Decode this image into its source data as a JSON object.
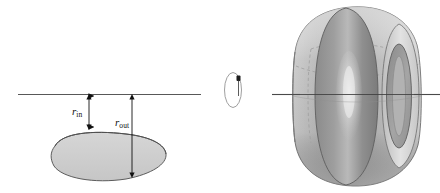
{
  "figure": {
    "caption": "",
    "background_color": "#ffffff",
    "labels": {
      "r_in": {
        "base": "r",
        "sub": "in",
        "text": "r_in"
      },
      "r_out": {
        "base": "r",
        "sub": "out",
        "text": "r_out"
      }
    },
    "axis": {
      "name": "axis-of-revolution",
      "color": "#4a4a4a",
      "left_segment": {
        "x1": 18,
        "x2": 201,
        "y": 94
      },
      "right_segment": {
        "x1": 272,
        "x2": 440,
        "y": 94
      }
    },
    "dimension_arrows": [
      {
        "name": "r-in-arrow",
        "x": 89,
        "y_top": 94,
        "y_bottom": 128,
        "color": "#111111",
        "double_headed": true
      },
      {
        "name": "r-out-arrow",
        "x": 132,
        "y_top": 94,
        "y_bottom": 176,
        "color": "#111111",
        "double_headed": true
      }
    ],
    "cross_section": {
      "name": "lens-cross-section",
      "fill": "#cfcfcf",
      "stroke": "#555555",
      "center": {
        "x": 108,
        "y": 157
      },
      "rx": 58,
      "ry": 24,
      "rotation_deg": -12
    },
    "profile_ellipse": {
      "name": "profile-ellipse",
      "stroke": "#9a9a9a",
      "center": {
        "x": 233,
        "y": 90
      },
      "rx": 8,
      "ry": 17,
      "marker": {
        "x": 239,
        "y": 79,
        "size": 4,
        "color": "#1a1a1a"
      }
    },
    "solid": {
      "name": "solid-of-revolution",
      "center": {
        "x": 355,
        "y": 96
      },
      "width": 160,
      "height": 186,
      "palette": {
        "body_light": "#d2d2d2",
        "body_mid": "#b4b4b4",
        "body_dark": "#8e8e8e",
        "body_darker": "#777777",
        "band_dark": "#7e7e7e",
        "highlight": "#e8e8e8",
        "rim_light": "#dcdcdc",
        "hole": "#9a9a9a",
        "outline": "#6e6e6e",
        "hidden_line": "#a3a3a3"
      }
    }
  }
}
